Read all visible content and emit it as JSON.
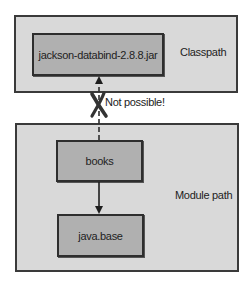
{
  "regions": {
    "classpath": {
      "label": "Classpath"
    },
    "module_path": {
      "label": "Module path"
    }
  },
  "nodes": {
    "jar": {
      "label": "jackson-databind-2.8.8.jar"
    },
    "books": {
      "label": "books"
    },
    "java_base": {
      "label": "java.base"
    }
  },
  "edges": [
    {
      "from": "books",
      "to": "jackson-databind-2.8.8.jar",
      "style": "dashed",
      "blocked": true,
      "annotation": "Not possible!"
    },
    {
      "from": "books",
      "to": "java.base",
      "style": "solid",
      "blocked": false
    }
  ],
  "colors": {
    "region_fill": "#d9d9d9",
    "node_fill": "#b0b0b0",
    "border": "#2e2e2e",
    "cross_mark": "#333333"
  }
}
